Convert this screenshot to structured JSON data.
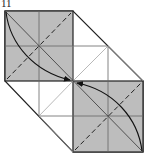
{
  "step_label": "11",
  "colors": {
    "paper_shaded": "#bdbdbd",
    "paper_white": "#ffffff",
    "edge": "#222222",
    "crease": "#666666",
    "light_crease": "#9a9a9a"
  },
  "diagram": {
    "type": "origami-fold-step",
    "shaded_squares": [
      "top-left",
      "bottom-right"
    ],
    "fold_lines": [
      "dashed valley diagonal top-left square",
      "dashed valley diagonal bottom-right square"
    ],
    "arrows": [
      "curved arrow from top-left corner to center",
      "curved arrow from bottom-right corner to center"
    ]
  }
}
